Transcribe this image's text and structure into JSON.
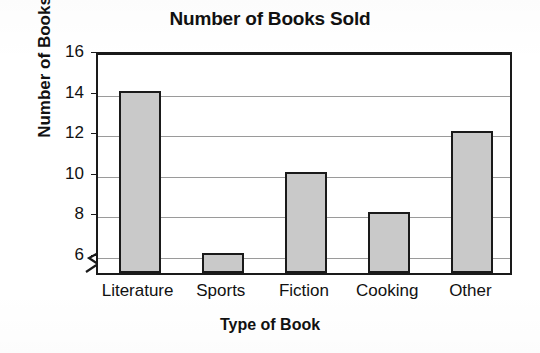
{
  "chart_data": {
    "type": "bar",
    "title": "Number of Books Sold",
    "xlabel": "Type of Book",
    "ylabel": "Number of Books",
    "categories": [
      "Literature",
      "Sports",
      "Fiction",
      "Cooking",
      "Other"
    ],
    "values": [
      14,
      6,
      10,
      8,
      12
    ],
    "yticks": [
      6,
      8,
      10,
      12,
      14,
      16
    ],
    "ylim": [
      5,
      16
    ],
    "axis_break": true,
    "axis_break_below": 6,
    "grid": true,
    "grid_axis": "y",
    "legend": null,
    "legend_position": "none",
    "bar_fill_color": "#c9c9c9",
    "bar_edge_color": "#1a1a1a",
    "gridline_color": "#9a9a9a",
    "background_color": "#ffffff",
    "series": [
      {
        "name": "Number of Books",
        "values": [
          14,
          6,
          10,
          8,
          12
        ]
      }
    ],
    "points": [
      {
        "category": "Literature",
        "value": 14
      },
      {
        "category": "Sports",
        "value": 6
      },
      {
        "category": "Fiction",
        "value": 10
      },
      {
        "category": "Cooking",
        "value": 8
      },
      {
        "category": "Other",
        "value": 12
      }
    ]
  }
}
